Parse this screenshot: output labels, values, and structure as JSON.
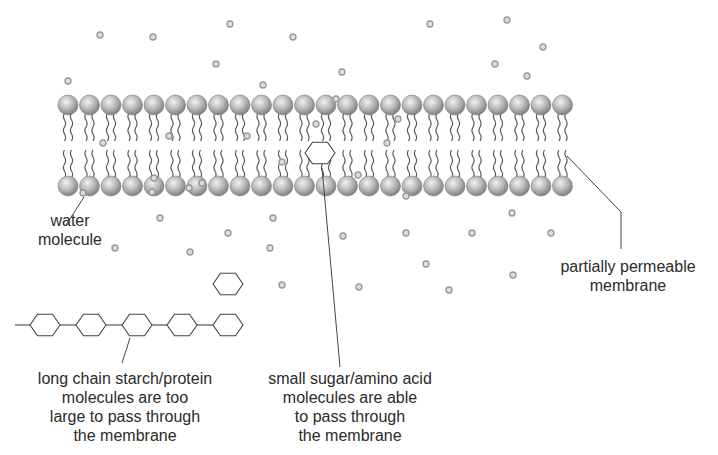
{
  "diagram": {
    "title": "Partially permeable membrane",
    "colors": {
      "background": "#ffffff",
      "lipid_head_light": "#eeeeee",
      "lipid_head_dark": "#8a8a8a",
      "lipid_tail": "#5a5a5a",
      "water_molecule": "#9a9a9a",
      "line": "#444444",
      "text": "#2b2b2b"
    },
    "membrane": {
      "head_count_per_row": 24,
      "first_head_x": 68,
      "head_spacing": 21.5,
      "head_radius": 10,
      "top_row_y": 105,
      "bottom_row_y": 186
    },
    "water_molecules": [
      [
        100,
        35
      ],
      [
        153,
        37
      ],
      [
        230,
        24
      ],
      [
        293,
        37
      ],
      [
        430,
        24
      ],
      [
        507,
        20
      ],
      [
        543,
        47
      ],
      [
        68,
        81
      ],
      [
        216,
        64
      ],
      [
        263,
        85
      ],
      [
        342,
        72
      ],
      [
        495,
        64
      ],
      [
        527,
        76
      ],
      [
        103,
        143
      ],
      [
        169,
        136
      ],
      [
        247,
        136
      ],
      [
        282,
        162
      ],
      [
        336,
        99
      ],
      [
        316,
        124
      ],
      [
        387,
        143
      ],
      [
        398,
        119
      ],
      [
        202,
        183
      ],
      [
        189,
        188
      ],
      [
        358,
        175
      ],
      [
        406,
        196
      ],
      [
        83,
        193
      ],
      [
        154,
        178
      ],
      [
        152,
        192
      ],
      [
        160,
        218
      ],
      [
        228,
        233
      ],
      [
        273,
        218
      ],
      [
        270,
        248
      ],
      [
        190,
        252
      ],
      [
        115,
        248
      ],
      [
        282,
        285
      ],
      [
        343,
        236
      ],
      [
        359,
        287
      ],
      [
        406,
        233
      ],
      [
        426,
        264
      ],
      [
        449,
        290
      ],
      [
        512,
        213
      ],
      [
        513,
        275
      ],
      [
        472,
        233
      ],
      [
        551,
        233
      ]
    ],
    "sugar_molecules": [
      {
        "cx": 320,
        "cy": 153,
        "r": 15
      },
      {
        "cx": 228,
        "cy": 284,
        "r": 15
      }
    ],
    "starch_chain": {
      "y": 325,
      "centers_x": [
        45,
        91,
        137,
        182,
        228
      ],
      "r": 15,
      "lead_in_x": 15
    },
    "leader_lines": {
      "water": [
        [
          84,
          197
        ],
        [
          66,
          225
        ]
      ],
      "starch": [
        [
          130,
          338
        ],
        [
          122,
          363
        ]
      ],
      "sugar": [
        [
          322,
          168
        ],
        [
          340,
          367
        ]
      ],
      "membrane": [
        [
          567,
          156
        ],
        [
          621,
          212
        ],
        [
          621,
          249
        ]
      ]
    },
    "labels": {
      "water": [
        "water",
        "molecule"
      ],
      "starch": [
        "long chain starch/protein",
        "molecules are too",
        "large to pass through",
        "the membrane"
      ],
      "sugar": [
        "small sugar/amino acid",
        "molecules are able",
        "to pass through",
        "the membrane"
      ],
      "membrane": [
        "partially permeable",
        "membrane"
      ]
    }
  }
}
